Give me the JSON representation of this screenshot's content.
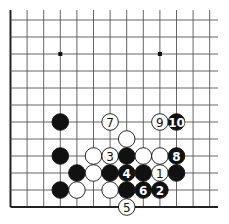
{
  "diagram": {
    "type": "go-board-fragment",
    "columns": 13,
    "rows": 12,
    "edges": [
      "left",
      "bottom"
    ],
    "star_points": [
      {
        "col": 3,
        "row": 9
      },
      {
        "col": 9,
        "row": 9
      }
    ],
    "colors": {
      "line": "#555555",
      "border": "#222222",
      "black_stone": "#111111",
      "white_stone": "#ffffff",
      "black_label": "#ffffff",
      "white_label": "#111111"
    },
    "stones": [
      {
        "color": "black",
        "col": 3,
        "row": 5,
        "label": ""
      },
      {
        "color": "white",
        "col": 6,
        "row": 5,
        "label": "7"
      },
      {
        "color": "white",
        "col": 9,
        "row": 5,
        "label": "9"
      },
      {
        "color": "black",
        "col": 10,
        "row": 5,
        "label": "10"
      },
      {
        "color": "white",
        "col": 7,
        "row": 4,
        "label": ""
      },
      {
        "color": "black",
        "col": 3,
        "row": 3,
        "label": ""
      },
      {
        "color": "white",
        "col": 5,
        "row": 3,
        "label": ""
      },
      {
        "color": "white",
        "col": 6,
        "row": 3,
        "label": "3"
      },
      {
        "color": "black",
        "col": 7,
        "row": 3,
        "label": ""
      },
      {
        "color": "white",
        "col": 8,
        "row": 3,
        "label": ""
      },
      {
        "color": "white",
        "col": 9,
        "row": 3,
        "label": ""
      },
      {
        "color": "black",
        "col": 10,
        "row": 3,
        "label": "8"
      },
      {
        "color": "black",
        "col": 4,
        "row": 2,
        "label": ""
      },
      {
        "color": "white",
        "col": 5,
        "row": 2,
        "label": ""
      },
      {
        "color": "black",
        "col": 6,
        "row": 2,
        "label": ""
      },
      {
        "color": "black",
        "col": 7,
        "row": 2,
        "label": "4"
      },
      {
        "color": "black",
        "col": 8,
        "row": 2,
        "label": ""
      },
      {
        "color": "white",
        "col": 9,
        "row": 2,
        "label": "1"
      },
      {
        "color": "black",
        "col": 10,
        "row": 2,
        "label": ""
      },
      {
        "color": "black",
        "col": 3,
        "row": 1,
        "label": ""
      },
      {
        "color": "white",
        "col": 4,
        "row": 1,
        "label": ""
      },
      {
        "color": "white",
        "col": 6,
        "row": 1,
        "label": ""
      },
      {
        "color": "black",
        "col": 7,
        "row": 1,
        "label": ""
      },
      {
        "color": "black",
        "col": 8,
        "row": 1,
        "label": "6"
      },
      {
        "color": "black",
        "col": 9,
        "row": 1,
        "label": "2"
      },
      {
        "color": "white",
        "col": 7,
        "row": 0,
        "label": "5"
      }
    ]
  },
  "caption": ""
}
